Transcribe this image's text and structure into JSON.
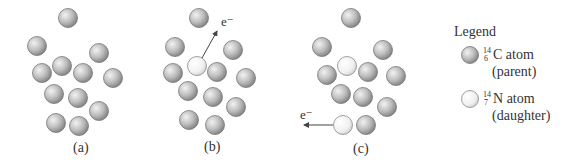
{
  "figure": {
    "panels": [
      {
        "label": "(a)",
        "label_pos": [
          82,
          149
        ],
        "atoms": [
          {
            "x": 68,
            "y": 18,
            "type": "parent"
          },
          {
            "x": 37,
            "y": 46,
            "type": "parent"
          },
          {
            "x": 99,
            "y": 53,
            "type": "parent"
          },
          {
            "x": 62,
            "y": 66,
            "type": "parent"
          },
          {
            "x": 42,
            "y": 73,
            "type": "parent"
          },
          {
            "x": 83,
            "y": 73,
            "type": "parent"
          },
          {
            "x": 113,
            "y": 78,
            "type": "parent"
          },
          {
            "x": 54,
            "y": 94,
            "type": "parent"
          },
          {
            "x": 78,
            "y": 98,
            "type": "parent"
          },
          {
            "x": 99,
            "y": 111,
            "type": "parent"
          },
          {
            "x": 56,
            "y": 123,
            "type": "parent"
          },
          {
            "x": 79,
            "y": 126,
            "type": "parent"
          }
        ]
      },
      {
        "label": "(b)",
        "label_pos": [
          213,
          148
        ],
        "electron": {
          "label": "e⁻",
          "from": [
            202,
            58
          ],
          "to": [
            217,
            31
          ],
          "label_pos": [
            222,
            13
          ]
        },
        "atoms": [
          {
            "x": 199,
            "y": 18,
            "type": "parent"
          },
          {
            "x": 175,
            "y": 47,
            "type": "parent"
          },
          {
            "x": 233,
            "y": 50,
            "type": "parent"
          },
          {
            "x": 197,
            "y": 66,
            "type": "daughter"
          },
          {
            "x": 173,
            "y": 73,
            "type": "parent"
          },
          {
            "x": 217,
            "y": 72,
            "type": "parent"
          },
          {
            "x": 246,
            "y": 78,
            "type": "parent"
          },
          {
            "x": 188,
            "y": 91,
            "type": "parent"
          },
          {
            "x": 213,
            "y": 97,
            "type": "parent"
          },
          {
            "x": 236,
            "y": 107,
            "type": "parent"
          },
          {
            "x": 189,
            "y": 120,
            "type": "parent"
          },
          {
            "x": 215,
            "y": 125,
            "type": "parent"
          }
        ]
      },
      {
        "label": "(c)",
        "label_pos": [
          362,
          150
        ],
        "electron": {
          "label": "e⁻",
          "from": [
            333,
            125
          ],
          "to": [
            304,
            125
          ],
          "label_pos": [
            300,
            106
          ]
        },
        "atoms": [
          {
            "x": 351,
            "y": 18,
            "type": "parent"
          },
          {
            "x": 322,
            "y": 47,
            "type": "parent"
          },
          {
            "x": 383,
            "y": 50,
            "type": "parent"
          },
          {
            "x": 347,
            "y": 66,
            "type": "daughter"
          },
          {
            "x": 327,
            "y": 75,
            "type": "parent"
          },
          {
            "x": 368,
            "y": 72,
            "type": "parent"
          },
          {
            "x": 396,
            "y": 76,
            "type": "parent"
          },
          {
            "x": 341,
            "y": 94,
            "type": "parent"
          },
          {
            "x": 363,
            "y": 97,
            "type": "parent"
          },
          {
            "x": 387,
            "y": 107,
            "type": "parent"
          },
          {
            "x": 343,
            "y": 125,
            "type": "daughter"
          },
          {
            "x": 366,
            "y": 125,
            "type": "parent"
          }
        ]
      }
    ],
    "legend": {
      "title": "Legend",
      "items": [
        {
          "mass": "14",
          "atomic": "6",
          "symbol": "C",
          "suffix": " atom",
          "role": "(parent)",
          "type": "parent"
        },
        {
          "mass": "14",
          "atomic": "7",
          "symbol": "N",
          "suffix": " atom",
          "role": "(daughter)",
          "type": "daughter"
        }
      ]
    },
    "colors": {
      "parent_light": "#eeeeee",
      "parent_dark": "#8a8a8a",
      "daughter_light": "#ffffff",
      "daughter_dark": "#d8d8d8",
      "stroke": "#777777",
      "text": "#333333"
    }
  }
}
